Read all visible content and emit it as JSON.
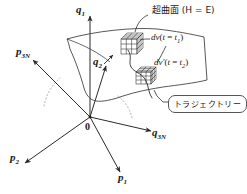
{
  "figure": {
    "title_note": "超曲面 (H = E)",
    "surface_label": "超曲面 (H = E)",
    "trajectory_label": "トラジェクトリー",
    "origin_label": "0",
    "axes": [
      {
        "name": "q1",
        "base": "q",
        "sub": "1",
        "x": 76,
        "y": 4
      },
      {
        "name": "p3N",
        "base": "p",
        "sub": "3N",
        "x": 16,
        "y": 46
      },
      {
        "name": "q2",
        "base": "q",
        "sub": "2",
        "x": 93,
        "y": 56
      },
      {
        "name": "q3N",
        "base": "q",
        "sub": "3N",
        "x": 152,
        "y": 127
      },
      {
        "name": "p2",
        "base": "p",
        "sub": "2",
        "x": 10,
        "y": 152
      },
      {
        "name": "p1",
        "base": "p",
        "sub": "1",
        "x": 118,
        "y": 172
      }
    ],
    "volume_elements": [
      {
        "name": "dv-t1",
        "prefix": "dv",
        "prime": "",
        "time": "(t = t",
        "tsub": "1",
        "close": ")",
        "x": 152,
        "y": 34
      },
      {
        "name": "dv-t2",
        "prefix": "dv",
        "prime": "′",
        "time": "(t = t",
        "tsub": "2",
        "close": ")",
        "x": 155,
        "y": 59
      }
    ],
    "colors": {
      "ink": "#1a1a1a",
      "line": "#3a3a3a",
      "box_border": "#55565a",
      "dotted": "#9a9a9a",
      "background": "#ffffff"
    }
  }
}
